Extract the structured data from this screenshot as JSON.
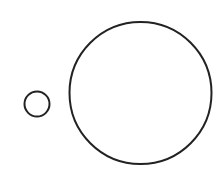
{
  "canvas": {
    "width": 219,
    "height": 183,
    "background": "#ffffff"
  },
  "stroke": {
    "color": "#222222",
    "width": 2
  },
  "shapes": [
    {
      "id": "small-circle",
      "type": "circle",
      "cx": 37,
      "cy": 104,
      "r": 12.5
    },
    {
      "id": "large-circle",
      "type": "circle",
      "cx": 140.5,
      "cy": 93,
      "r": 71
    }
  ]
}
